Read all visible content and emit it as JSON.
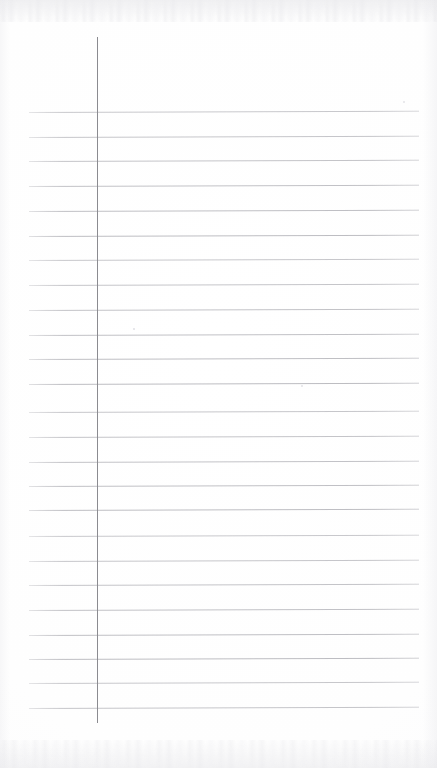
{
  "document": {
    "type": "ruled-notebook-paper",
    "title": "",
    "content": "",
    "is_blank": true,
    "page_width": 437,
    "page_height": 768
  },
  "paper": {
    "background_color": "#ffffff",
    "edge_tint_color": "#e6e6ea"
  },
  "margin_rule": {
    "name": "vertical-margin-line",
    "color": "#8b8b90",
    "x": 97,
    "y_start": 37,
    "y_end": 723,
    "thickness": 1.4
  },
  "ruling": {
    "color": "#b9b9be",
    "thickness": 1,
    "x_start": 29,
    "x_end": 419,
    "spacing": 24.8,
    "count": 25,
    "first_line_y": 112,
    "last_line_y": 708,
    "skew_degrees": -0.18,
    "line_y_positions": [
      112,
      137,
      161,
      186,
      211,
      236,
      260,
      285,
      310,
      335,
      359,
      384,
      412,
      437,
      462,
      486,
      510,
      536,
      561,
      585,
      610,
      635,
      659,
      683,
      708
    ]
  },
  "specks": [
    {
      "name": "scan-speck-upper-right",
      "x": 403,
      "y": 101,
      "size": 2.2
    },
    {
      "name": "scan-speck-mid-left",
      "x": 133,
      "y": 328,
      "size": 1.6
    },
    {
      "name": "scan-speck-mid-right",
      "x": 301,
      "y": 385,
      "size": 1.8
    }
  ],
  "writing": {
    "lines": []
  }
}
